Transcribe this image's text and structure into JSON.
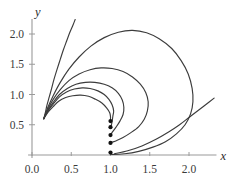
{
  "figure": {
    "title": "",
    "axis_color": "#9a9a9a",
    "curve_color": "#3c3c3c",
    "dot_color": "#121212",
    "background": "#ffffff"
  },
  "chart_data": {
    "type": "line",
    "title": "",
    "xlabel": "x",
    "ylabel": "y",
    "xlim": [
      -0.05,
      2.35
    ],
    "ylim": [
      -0.05,
      2.25
    ],
    "grid": false,
    "legend": null,
    "x_ticks": [
      0.0,
      0.5,
      1.0,
      1.5,
      2.0
    ],
    "x_tick_labels": [
      "0.0",
      "0.5",
      "1.0",
      "1.5",
      "2.0"
    ],
    "y_ticks": [
      0.5,
      1.0,
      1.5,
      2.0
    ],
    "y_tick_labels": [
      "0.5",
      "1.0",
      "1.5",
      "2.0"
    ],
    "common_origin": [
      0.15,
      0.6
    ],
    "terminal_x": 1.0,
    "series": [
      {
        "name": "trajectory-1",
        "comment": "escapes through top of frame",
        "points": [
          [
            0.15,
            0.6
          ],
          [
            0.17,
            0.7
          ],
          [
            0.19,
            0.82
          ],
          [
            0.22,
            0.96
          ],
          [
            0.25,
            1.1
          ],
          [
            0.28,
            1.25
          ],
          [
            0.32,
            1.42
          ],
          [
            0.36,
            1.58
          ],
          [
            0.4,
            1.74
          ],
          [
            0.44,
            1.88
          ],
          [
            0.48,
            2.02
          ],
          [
            0.52,
            2.14
          ],
          [
            0.55,
            2.24
          ]
        ],
        "endpoint_dot": false
      },
      {
        "name": "trajectory-2",
        "comment": "largest loop, peaks near y=2.05, exits bottom right",
        "points": [
          [
            0.15,
            0.6
          ],
          [
            0.2,
            0.78
          ],
          [
            0.27,
            0.98
          ],
          [
            0.36,
            1.2
          ],
          [
            0.47,
            1.42
          ],
          [
            0.6,
            1.62
          ],
          [
            0.75,
            1.8
          ],
          [
            0.92,
            1.94
          ],
          [
            1.1,
            2.03
          ],
          [
            1.28,
            2.06
          ],
          [
            1.46,
            2.02
          ],
          [
            1.62,
            1.92
          ],
          [
            1.78,
            1.76
          ],
          [
            1.9,
            1.56
          ],
          [
            1.99,
            1.34
          ],
          [
            2.04,
            1.1
          ],
          [
            2.05,
            0.88
          ],
          [
            2.02,
            0.68
          ],
          [
            1.95,
            0.5
          ],
          [
            1.84,
            0.35
          ],
          [
            1.7,
            0.22
          ],
          [
            1.54,
            0.13
          ],
          [
            1.36,
            0.06
          ],
          [
            1.18,
            0.02
          ],
          [
            1.02,
            0.01
          ]
        ],
        "endpoint": [
          1.0,
          0.04
        ],
        "endpoint_dot": true
      },
      {
        "name": "trajectory-3",
        "comment": "loop peaking near y=1.44",
        "points": [
          [
            0.15,
            0.6
          ],
          [
            0.2,
            0.75
          ],
          [
            0.27,
            0.92
          ],
          [
            0.36,
            1.08
          ],
          [
            0.47,
            1.23
          ],
          [
            0.6,
            1.34
          ],
          [
            0.74,
            1.41
          ],
          [
            0.88,
            1.44
          ],
          [
            1.02,
            1.43
          ],
          [
            1.16,
            1.38
          ],
          [
            1.28,
            1.29
          ],
          [
            1.38,
            1.17
          ],
          [
            1.45,
            1.03
          ],
          [
            1.48,
            0.88
          ],
          [
            1.47,
            0.73
          ],
          [
            1.43,
            0.59
          ],
          [
            1.36,
            0.47
          ],
          [
            1.26,
            0.37
          ],
          [
            1.16,
            0.29
          ],
          [
            1.08,
            0.24
          ],
          [
            1.02,
            0.21
          ]
        ],
        "endpoint": [
          1.0,
          0.2
        ],
        "endpoint_dot": true
      },
      {
        "name": "trajectory-4",
        "comment": "loop peaking near y=1.20",
        "points": [
          [
            0.15,
            0.6
          ],
          [
            0.2,
            0.73
          ],
          [
            0.27,
            0.87
          ],
          [
            0.35,
            1.0
          ],
          [
            0.45,
            1.1
          ],
          [
            0.56,
            1.17
          ],
          [
            0.68,
            1.2
          ],
          [
            0.8,
            1.2
          ],
          [
            0.92,
            1.17
          ],
          [
            1.02,
            1.11
          ],
          [
            1.1,
            1.02
          ],
          [
            1.15,
            0.91
          ],
          [
            1.17,
            0.79
          ],
          [
            1.16,
            0.67
          ],
          [
            1.12,
            0.56
          ],
          [
            1.07,
            0.46
          ],
          [
            1.03,
            0.39
          ],
          [
            1.01,
            0.35
          ]
        ],
        "endpoint": [
          1.0,
          0.33
        ],
        "endpoint_dot": true
      },
      {
        "name": "trajectory-5",
        "comment": "loop peaking near y=1.10, tight return",
        "points": [
          [
            0.15,
            0.6
          ],
          [
            0.2,
            0.72
          ],
          [
            0.27,
            0.84
          ],
          [
            0.35,
            0.96
          ],
          [
            0.44,
            1.04
          ],
          [
            0.54,
            1.09
          ],
          [
            0.64,
            1.11
          ],
          [
            0.74,
            1.1
          ],
          [
            0.84,
            1.06
          ],
          [
            0.92,
            1.0
          ],
          [
            0.98,
            0.92
          ],
          [
            1.02,
            0.83
          ],
          [
            1.04,
            0.73
          ],
          [
            1.03,
            0.64
          ],
          [
            1.02,
            0.55
          ],
          [
            1.01,
            0.49
          ]
        ],
        "endpoint": [
          1.0,
          0.46
        ],
        "endpoint_dot": true
      },
      {
        "name": "trajectory-6",
        "comment": "innermost loop peaking near y=0.98",
        "points": [
          [
            0.15,
            0.6
          ],
          [
            0.2,
            0.7
          ],
          [
            0.27,
            0.8
          ],
          [
            0.34,
            0.89
          ],
          [
            0.43,
            0.95
          ],
          [
            0.52,
            0.98
          ],
          [
            0.62,
            0.99
          ],
          [
            0.72,
            0.97
          ],
          [
            0.81,
            0.92
          ],
          [
            0.89,
            0.86
          ],
          [
            0.95,
            0.78
          ],
          [
            0.99,
            0.7
          ],
          [
            1.0,
            0.63
          ],
          [
            1.0,
            0.58
          ]
        ],
        "endpoint": [
          1.0,
          0.56
        ],
        "endpoint_dot": true
      },
      {
        "name": "trajectory-7",
        "comment": "outer branch entering from lower right, exits frame",
        "points": [
          [
            1.05,
            0.02
          ],
          [
            1.22,
            0.07
          ],
          [
            1.4,
            0.15
          ],
          [
            1.58,
            0.26
          ],
          [
            1.74,
            0.38
          ],
          [
            1.88,
            0.5
          ],
          [
            2.0,
            0.62
          ],
          [
            2.12,
            0.74
          ],
          [
            2.22,
            0.84
          ],
          [
            2.32,
            0.94
          ]
        ],
        "endpoint_dot": false
      }
    ],
    "endpoint_dots": [
      {
        "x": 1.0,
        "y": 0.04
      },
      {
        "x": 1.0,
        "y": 0.2
      },
      {
        "x": 1.0,
        "y": 0.33
      },
      {
        "x": 1.0,
        "y": 0.46
      },
      {
        "x": 1.0,
        "y": 0.56
      }
    ]
  }
}
